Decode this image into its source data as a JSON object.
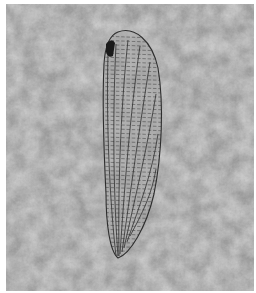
{
  "image": {
    "subject": "fossil insect wing impression on limestone",
    "description": "Elongate oval wing with dense reticulate venation and a dark pterostigma near the apex, set on mottled grey stone",
    "colors": {
      "border": "#ffffff",
      "stone": "#a9a9a9",
      "stone_light": "#c4c4c4",
      "stone_dark": "#8c8c8c",
      "vein": "#2e2e2e",
      "pterostigma": "#1a1a1a"
    }
  }
}
